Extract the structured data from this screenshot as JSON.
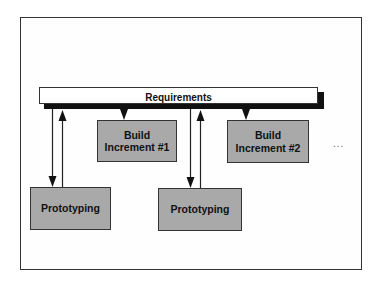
{
  "diagram": {
    "type": "flow",
    "requirements": {
      "label": "Requirements"
    },
    "build_increments": [
      {
        "line1": "Build",
        "line2": "Increment #1"
      },
      {
        "line1": "Build",
        "line2": "Increment #2"
      }
    ],
    "prototyping": [
      {
        "label": "Prototyping"
      },
      {
        "label": "Prototyping"
      }
    ],
    "continuation": "...",
    "colors": {
      "box_fill": "#a9a9a9",
      "requirements_fill": "#ffffff",
      "shadow": "#111111",
      "stroke": "#333333"
    },
    "edges": [
      {
        "from": "Requirements",
        "to": "Build Increment #1"
      },
      {
        "from": "Requirements",
        "to": "Build Increment #2"
      },
      {
        "from": "Requirements",
        "to": "Prototyping (1)"
      },
      {
        "from": "Prototyping (1)",
        "to": "Requirements"
      },
      {
        "from": "Requirements",
        "to": "Prototyping (2)"
      },
      {
        "from": "Prototyping (2)",
        "to": "Requirements"
      }
    ]
  }
}
